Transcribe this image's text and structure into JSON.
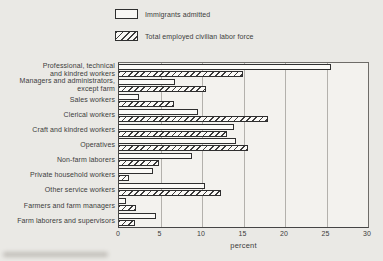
{
  "chart_data": {
    "type": "bar",
    "orientation": "horizontal",
    "categories": [
      "Professional, technical and kindred workers",
      "Managers and administrators, except farm",
      "Sales workers",
      "Clerical workers",
      "Craft and kindred workers",
      "Operatives",
      "Non-farm laborers",
      "Private household workers",
      "Other service workers",
      "Farmers and farm managers",
      "Farm laborers and supervisors"
    ],
    "category_lines": [
      [
        "Professional, technical",
        "and kindred workers"
      ],
      [
        "Managers and administrators,",
        "except farm"
      ],
      [
        "Sales workers"
      ],
      [
        "Clerical workers"
      ],
      [
        "Craft and kindred workers"
      ],
      [
        "Operatives"
      ],
      [
        "Non-farm laborers"
      ],
      [
        "Private household workers"
      ],
      [
        "Other service workers"
      ],
      [
        "Farmers and farm managers"
      ],
      [
        "Farm laborers and supervisors"
      ]
    ],
    "series": [
      {
        "name": "Immigrants admitted",
        "pattern": "plain",
        "values": [
          25.5,
          6.8,
          2.4,
          9.5,
          13.9,
          14.1,
          8.8,
          4.1,
          10.4,
          0.8,
          4.5
        ]
      },
      {
        "name": "Total employed civilian labor force",
        "pattern": "hatched",
        "values": [
          14.9,
          10.5,
          6.6,
          18.0,
          13.0,
          15.5,
          4.8,
          1.2,
          12.3,
          2.0,
          1.9
        ]
      }
    ],
    "xlabel": "percent",
    "xlim": [
      0,
      30
    ],
    "xticks": [
      0,
      5,
      10,
      15,
      20,
      25,
      30
    ],
    "grid": true,
    "legend_position": "top"
  },
  "colors": {
    "background": "#eae9e5",
    "plot_background": "#f3f2ee",
    "bar_fill": "#fbfaf7",
    "bar_outline": "#2f2f2f",
    "hatch_line": "#3d3d3d",
    "grid_line": "#b3b1ac",
    "text": "#3c3c3c"
  }
}
